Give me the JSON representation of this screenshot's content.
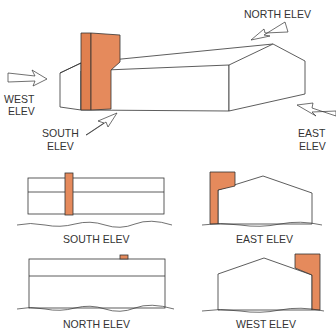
{
  "colors": {
    "chimney": "#e58a5c",
    "line": "#333333",
    "background": "#ffffff"
  },
  "isometric": {
    "labels": {
      "north": "NORTH ELEV",
      "west_line1": "WEST",
      "west_line2": "ELEV",
      "south_line1": "SOUTH",
      "south_line2": "ELEV",
      "east_line1": "EAST",
      "east_line2": "ELEV"
    }
  },
  "elevations": [
    {
      "id": "south",
      "label": "SOUTH ELEV"
    },
    {
      "id": "east",
      "label": "EAST ELEV"
    },
    {
      "id": "north",
      "label": "NORTH ELEV"
    },
    {
      "id": "west",
      "label": "WEST ELEV"
    }
  ]
}
